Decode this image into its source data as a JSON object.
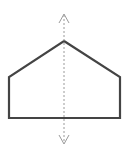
{
  "diagram": {
    "shape": {
      "type": "pentagon",
      "points": [
        [
          64,
          41
        ],
        [
          120,
          77
        ],
        [
          120,
          118
        ],
        [
          9,
          118
        ],
        [
          9,
          77
        ]
      ],
      "stroke": "#444444",
      "stroke_width": 2.2,
      "fill": "none"
    },
    "symmetry_line": {
      "orientation": "vertical",
      "x": 64,
      "y_start": 15,
      "y_end": 143,
      "stroke": "#9a9a9a",
      "dash": "2,2",
      "arrow_top": true,
      "arrow_bottom": true
    }
  }
}
